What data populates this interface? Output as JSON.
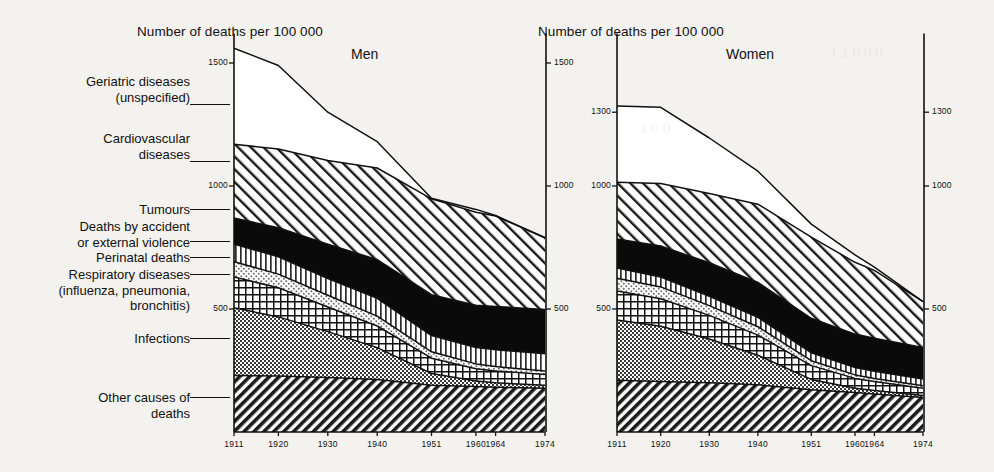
{
  "figure": {
    "left_axis_title": "Number of deaths per 100 000",
    "right_axis_title": "Number of deaths per 100 000",
    "panel_men": "Men",
    "panel_women": "Women"
  },
  "legend": {
    "items": [
      {
        "label": "Geriatric diseases\n(unspecified)",
        "key": "geriatric",
        "fill": "white"
      },
      {
        "label": "Cardiovascular\ndiseases",
        "key": "cardiovascular",
        "fill": "diagonal-hatch-up"
      },
      {
        "label": "Tumours",
        "key": "tumours",
        "fill": "solid-black"
      },
      {
        "label": "Deaths by accident\nor external violence",
        "key": "accident",
        "fill": "vertical-lines"
      },
      {
        "label": "Perinatal deaths",
        "key": "perinatal",
        "fill": "light-stipple"
      },
      {
        "label": "Respiratory diseases\n(influenza, pneumonia,\nbronchitis)",
        "key": "respiratory",
        "fill": "cross-grid"
      },
      {
        "label": "Infections",
        "key": "infections",
        "fill": "dense-stipple"
      },
      {
        "label": "Other causes of\ndeaths",
        "key": "other",
        "fill": "diagonal-hatch-down"
      }
    ]
  },
  "chart_data": {
    "type": "area",
    "title": "Number of deaths per 100 000",
    "xlabel": "",
    "ylabel": "Number of deaths per 100 000",
    "x": [
      1911,
      1920,
      1930,
      1940,
      1951,
      1960,
      1964,
      1974
    ],
    "xtick_labels": [
      "1911",
      "1920",
      "1930",
      "1940",
      "1951",
      "1960",
      "1964",
      "1974"
    ],
    "grid": false,
    "legend_position": "left-outside",
    "stack_order_bottom_to_top": [
      "other",
      "infections",
      "respiratory",
      "perinatal",
      "accident",
      "tumours",
      "cardiovascular",
      "geriatric"
    ],
    "panels": [
      {
        "name": "Men",
        "ylim": [
          0,
          1620
        ],
        "ytick_labels": [
          "1500",
          "1000",
          "500"
        ],
        "yticks": [
          1500,
          1000,
          500
        ],
        "right_axis_ytick_labels": [
          "1500",
          "1000",
          "500"
        ],
        "totals": [
          1560,
          1490,
          1300,
          1180,
          950,
          905,
          880,
          790
        ],
        "series": [
          {
            "name": "Other causes of deaths",
            "key": "other",
            "values": [
              230,
              228,
              222,
              213,
              190,
              185,
              182,
              178
            ]
          },
          {
            "name": "Infections",
            "key": "infections",
            "values": [
              275,
              240,
              186,
              130,
              48,
              22,
              18,
              12
            ]
          },
          {
            "name": "Respiratory diseases (influenza, pneumonia, bronchitis)",
            "key": "respiratory",
            "values": [
              125,
              118,
              100,
              88,
              62,
              50,
              48,
              44
            ]
          },
          {
            "name": "Perinatal deaths",
            "key": "perinatal",
            "values": [
              62,
              56,
              48,
              40,
              26,
              20,
              18,
              14
            ]
          },
          {
            "name": "Deaths by accident or external violence",
            "key": "accident",
            "values": [
              72,
              70,
              68,
              72,
              66,
              66,
              68,
              70
            ]
          },
          {
            "name": "Tumours",
            "key": "tumours",
            "values": [
              106,
              118,
              140,
              158,
              166,
              172,
              176,
              180
            ]
          },
          {
            "name": "Cardiovascular diseases",
            "key": "cardiovascular",
            "values": [
              300,
              320,
              340,
              372,
              390,
              378,
              368,
              292
            ]
          },
          {
            "name": "Geriatric diseases (unspecified)",
            "key": "geriatric",
            "values": [
              390,
              340,
              196,
              107,
              2,
              12,
              2,
              0
            ]
          }
        ]
      },
      {
        "name": "Women",
        "ylim": [
          0,
          1620
        ],
        "ytick_labels": [
          "1300",
          "1000",
          "500"
        ],
        "yticks": [
          1300,
          1000,
          500
        ],
        "right_axis_ytick_labels": [
          "1300",
          "1000",
          "500"
        ],
        "totals": [
          1325,
          1320,
          1195,
          1060,
          845,
          720,
          670,
          530
        ],
        "series": [
          {
            "name": "Other causes of deaths",
            "key": "other",
            "values": [
              210,
              205,
              200,
              192,
              172,
              160,
              155,
              140
            ]
          },
          {
            "name": "Infections",
            "key": "infections",
            "values": [
              245,
              225,
              178,
              120,
              42,
              18,
              14,
              8
            ]
          },
          {
            "name": "Respiratory diseases (influenza, pneumonia, bronchitis)",
            "key": "respiratory",
            "values": [
              118,
              112,
              96,
              82,
              56,
              40,
              36,
              30
            ]
          },
          {
            "name": "Perinatal deaths",
            "key": "perinatal",
            "values": [
              52,
              48,
              40,
              34,
              20,
              14,
              12,
              10
            ]
          },
          {
            "name": "Deaths by accident or external violence",
            "key": "accident",
            "values": [
              42,
              40,
              38,
              38,
              32,
              30,
              30,
              28
            ]
          },
          {
            "name": "Tumours",
            "key": "tumours",
            "values": [
              118,
              126,
              136,
              142,
              140,
              136,
              134,
              128
            ]
          },
          {
            "name": "Cardiovascular diseases",
            "key": "cardiovascular",
            "values": [
              230,
              254,
              282,
              318,
              330,
              292,
              276,
              186
            ]
          },
          {
            "name": "Geriatric diseases (unspecified)",
            "key": "geriatric",
            "values": [
              310,
              310,
              225,
              134,
              53,
              30,
              13,
              0
            ]
          }
        ]
      }
    ]
  }
}
